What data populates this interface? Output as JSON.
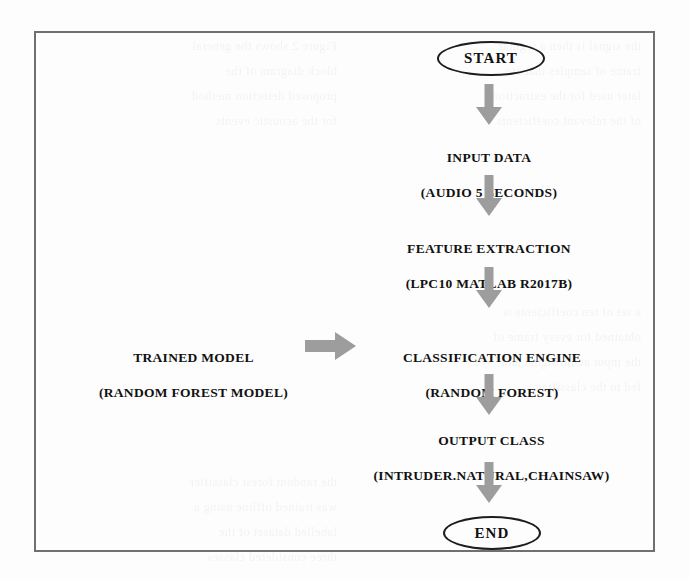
{
  "diagram": {
    "accent_gray": "#9d9d9d",
    "frame_color": "#707070",
    "text_color": "#111111",
    "nodes": {
      "start": {
        "label": "START",
        "shape": "ellipse"
      },
      "input_data": {
        "line1": "INPUT DATA",
        "line2": "(AUDIO 5 SECONDS)",
        "shape": "text"
      },
      "feature_extraction": {
        "line1": "FEATURE EXTRACTION",
        "line2": "(LPC10 MATLAB R2017B)",
        "shape": "text"
      },
      "trained_model": {
        "line1": "TRAINED MODEL",
        "line2": "(RANDOM FOREST MODEL)",
        "shape": "text"
      },
      "classification_engine": {
        "line1": "CLASSIFICATION ENGINE",
        "line2": "(RANDOM FOREST)",
        "shape": "text"
      },
      "output_class": {
        "line1": "OUTPUT CLASS",
        "line2": "(INTRUDER.NATURAL,CHAINSAW)",
        "shape": "text"
      },
      "end": {
        "label": "END",
        "shape": "ellipse"
      }
    },
    "connectors": [
      {
        "name": "start-to-input",
        "direction": "down"
      },
      {
        "name": "input-to-feature",
        "direction": "down"
      },
      {
        "name": "feature-to-classification",
        "direction": "down"
      },
      {
        "name": "trainedmodel-to-classification",
        "direction": "right"
      },
      {
        "name": "classification-to-output",
        "direction": "down"
      },
      {
        "name": "output-to-end",
        "direction": "down"
      }
    ]
  },
  "background_bleed": {
    "col_a": "the signal is then  a  regular\nframe   of   samples   that  are\nlater   used  for  the  extraction\nof  the  relevant  coefficients",
    "col_b": "Figure  2  shows  the  general\nblock    diagram    of    the\nproposed   detection   method\nfor   the   acoustic   events",
    "col_c": "a  set  of  ten  coefficients  is\nobtained  for  every  frame  of\nthe  input  audio  signal  and\nfed    to    the    classifier",
    "col_d": "the  random  forest  classifier\nwas  trained  offline  using  a\nlabelled    dataset    of   the\nthree   considered   classes"
  }
}
